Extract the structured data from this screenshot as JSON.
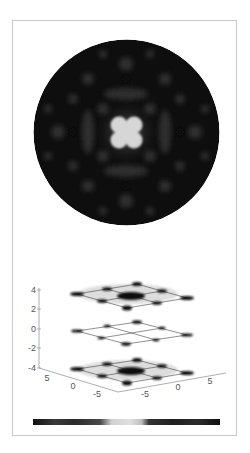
{
  "figure": {
    "top_panel": {
      "type": "circular-intensity-map",
      "description": "Circular grayscale pattern with bright four-lobed center",
      "background_color": "#0d0d0d",
      "center_color": "#d8d8d8"
    },
    "bottom_panel": {
      "type": "3d-slice-plot",
      "z_ticks": [
        "4",
        "2",
        "0",
        "-2",
        "-4"
      ],
      "x_ticks": [
        "5",
        "0",
        "-5"
      ],
      "y_ticks": [
        "-5",
        "0",
        "5"
      ],
      "slices": [
        {
          "z": 4,
          "label": "top-slice"
        },
        {
          "z": 0,
          "label": "middle-slice"
        },
        {
          "z": -4,
          "label": "bottom-slice"
        }
      ]
    },
    "colorbar": {
      "orientation": "horizontal",
      "colormap": "dark-light-dark gray",
      "stops": [
        "#111111",
        "#333333",
        "#222222",
        "#444444",
        "#dddddd",
        "#cccccc",
        "#333333",
        "#1a1a1a",
        "#2a2a2a",
        "#111111"
      ]
    }
  }
}
